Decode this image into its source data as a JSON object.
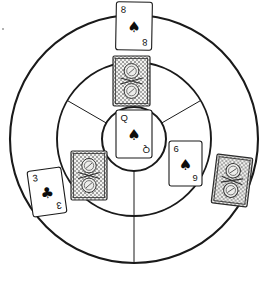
{
  "scene": {
    "title": "Concentric target with playing cards",
    "background": "#ffffff",
    "stroke": "#1a1a1a",
    "width": 271,
    "height": 281
  },
  "target": {
    "center_x": 134,
    "center_y": 139,
    "rings": [
      {
        "name": "outer-ring",
        "radius": 124,
        "stroke_width": 2.1
      },
      {
        "name": "middle-ring",
        "radius": 77,
        "stroke_width": 1.9
      },
      {
        "name": "inner-ring",
        "radius": 32,
        "stroke_width": 2.0
      }
    ],
    "spokes": [
      {
        "name": "spoke-upper-left",
        "angle_deg": 210,
        "stroke_width": 1.0
      },
      {
        "name": "spoke-upper-right",
        "angle_deg": 330,
        "stroke_width": 1.0
      },
      {
        "name": "spoke-bottom",
        "angle_deg": 90,
        "stroke_width": 1.0
      }
    ]
  },
  "cards": [
    {
      "id": "card-8-spades",
      "state": "face-up",
      "rank": "8",
      "suit": "spades",
      "suit_glyph": "♠",
      "corner_top": "8",
      "corner_bottom": "8",
      "x": 116,
      "y": 2,
      "width": 36,
      "height": 48,
      "rotation_deg": 1
    },
    {
      "id": "card-back-top",
      "state": "face-down",
      "rank": "",
      "suit": "",
      "x": 113,
      "y": 56,
      "width": 37,
      "height": 50,
      "rotation_deg": 0
    },
    {
      "id": "card-queen-spades",
      "state": "face-up",
      "rank": "Q",
      "suit": "spades",
      "suit_glyph": "♠",
      "corner_top": "Q",
      "corner_bottom": "Q",
      "x": 116,
      "y": 110,
      "width": 36,
      "height": 48,
      "rotation_deg": 0
    },
    {
      "id": "card-back-left",
      "state": "face-down",
      "rank": "",
      "suit": "",
      "x": 71,
      "y": 151,
      "width": 36,
      "height": 49,
      "rotation_deg": 0
    },
    {
      "id": "card-3-clubs",
      "state": "face-up",
      "rank": "3",
      "suit": "clubs",
      "suit_glyph": "♣",
      "corner_top": "3",
      "corner_bottom": "3",
      "x": 30,
      "y": 169,
      "width": 34,
      "height": 46,
      "rotation_deg": -8
    },
    {
      "id": "card-6-spades",
      "state": "face-up",
      "rank": "6",
      "suit": "spades",
      "suit_glyph": "♠",
      "corner_top": "6",
      "corner_bottom": "6",
      "x": 169,
      "y": 141,
      "width": 33,
      "height": 45,
      "rotation_deg": 0
    },
    {
      "id": "card-back-right",
      "state": "face-down",
      "rank": "",
      "suit": "",
      "x": 214,
      "y": 156,
      "width": 36,
      "height": 49,
      "rotation_deg": 7
    }
  ],
  "artifacts": [
    {
      "name": "speck",
      "x": 3,
      "y": 29,
      "size": 2
    }
  ]
}
